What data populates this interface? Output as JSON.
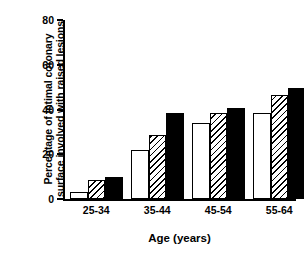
{
  "chart_data": {
    "type": "bar",
    "title": "",
    "xlabel": "Age (years)",
    "ylabel": "Percentage of intimal coronary surface involved with raised lesions",
    "ylabel_lines": [
      "Percentage of intimal coronary",
      "surface involved with raised lesions"
    ],
    "categories": [
      "25-34",
      "35-44",
      "45-54",
      "55-64"
    ],
    "series": [
      {
        "name": "open",
        "fill": "white",
        "values": [
          3,
          22,
          34,
          38.5
        ]
      },
      {
        "name": "hatched",
        "fill": "diagonal-hatch",
        "values": [
          8.5,
          28.5,
          38.5,
          46.5
        ]
      },
      {
        "name": "solid",
        "fill": "black",
        "values": [
          10,
          38.5,
          40.5,
          49.5
        ]
      }
    ],
    "ylim": [
      0,
      80
    ],
    "yticks": [
      0,
      20,
      40,
      60,
      80
    ],
    "ytick_labels": [
      "0",
      "20",
      "40",
      "60",
      "80"
    ],
    "grid": false,
    "legend": "none",
    "colors": {
      "axis": "#000000",
      "bar_outline": "#000000",
      "bar_open": "#ffffff",
      "bar_solid": "#000000",
      "background": "#ffffff"
    }
  }
}
